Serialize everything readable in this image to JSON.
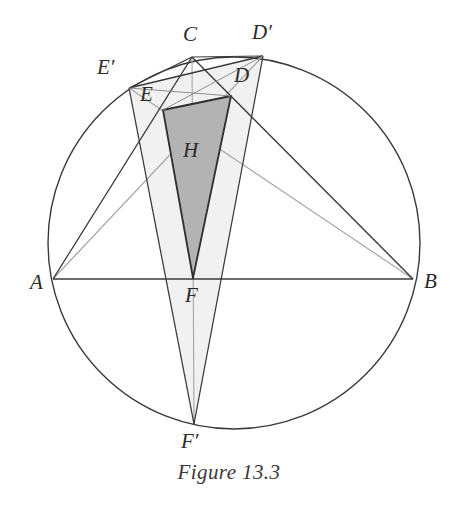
{
  "figure": {
    "caption": "Figure 13.3",
    "type": "geometry-diagram",
    "canvas": {
      "width": 458,
      "height": 507
    },
    "colors": {
      "stroke_dark": "#3a3a3a",
      "stroke_light": "#9a9a9a",
      "fill_dark_triangle": "#b3b3b3",
      "fill_light_triangle": "#f1f1f1",
      "background": "#ffffff",
      "label_color": "#2b2b2b"
    },
    "circle": {
      "cx": 234,
      "cy": 243,
      "r": 186
    },
    "points": {
      "A": {
        "x": 53,
        "y": 279,
        "label": "A",
        "label_x": 30,
        "label_y": 272
      },
      "B": {
        "x": 413,
        "y": 279,
        "label": "B",
        "label_x": 424,
        "label_y": 271
      },
      "C": {
        "x": 192,
        "y": 57,
        "label": "C",
        "label_x": 183,
        "label_y": 24
      },
      "D": {
        "x": 231,
        "y": 96,
        "label": "D",
        "label_x": 234,
        "label_y": 65
      },
      "E": {
        "x": 163,
        "y": 110,
        "label": "E",
        "label_x": 140,
        "label_y": 84
      },
      "F": {
        "x": 193,
        "y": 278,
        "label": "F",
        "label_x": 185,
        "label_y": 285
      },
      "Dp": {
        "x": 263,
        "y": 56,
        "label": "D′",
        "label_x": 252,
        "label_y": 22
      },
      "Ep": {
        "x": 129,
        "y": 88,
        "label": "E′",
        "label_x": 97,
        "label_y": 57
      },
      "Fp": {
        "x": 194,
        "y": 424,
        "label": "F′",
        "label_x": 181,
        "label_y": 431
      },
      "H": {
        "x": 192,
        "y": 150,
        "label": "H",
        "label_x": 183,
        "label_y": 140
      }
    },
    "shapes": {
      "outer_triangle": {
        "name": "triangle-ABC",
        "vertices": [
          "A",
          "B",
          "C"
        ]
      },
      "reflected_triangle": {
        "name": "triangle-EpDpFp",
        "vertices": [
          "Ep",
          "Dp",
          "Fp"
        ],
        "fill": "light"
      },
      "orthic_triangle": {
        "name": "triangle-DEF",
        "vertices": [
          "D",
          "E",
          "F"
        ],
        "fill": "dark"
      }
    },
    "segments": [
      {
        "name": "chord-AB",
        "from": "A",
        "to": "B",
        "weight": "dark"
      },
      {
        "name": "side-AC",
        "from": "A",
        "to": "C",
        "weight": "dark"
      },
      {
        "name": "side-BC",
        "from": "B",
        "to": "C",
        "weight": "dark"
      },
      {
        "name": "altitude-CF-extended",
        "from": "C",
        "to": "Fp",
        "weight": "light"
      },
      {
        "name": "altitude-AD-extended",
        "from": "A",
        "to": "Dp",
        "weight": "light"
      },
      {
        "name": "altitude-BE-extended",
        "from": "B",
        "to": "Ep",
        "weight": "light"
      },
      {
        "name": "cevian-AE",
        "from": "A",
        "to": "Ep",
        "weight": "dark"
      },
      {
        "name": "cevian-BD",
        "from": "B",
        "to": "Dp",
        "weight": "dark"
      },
      {
        "name": "chord-CEp",
        "from": "C",
        "to": "Ep",
        "weight": "dark"
      },
      {
        "name": "chord-CDp",
        "from": "C",
        "to": "Dp",
        "weight": "dark"
      },
      {
        "name": "side-EF-dark",
        "from": "E",
        "to": "F",
        "weight": "dark"
      },
      {
        "name": "side-DF-dark",
        "from": "D",
        "to": "F",
        "weight": "dark"
      },
      {
        "name": "side-ED-dark",
        "from": "E",
        "to": "D",
        "weight": "dark"
      },
      {
        "name": "diagonal-EH-D",
        "from": "E",
        "to": "D",
        "weight": "light"
      },
      {
        "name": "side-EpFp",
        "from": "Ep",
        "to": "Fp",
        "weight": "dark"
      },
      {
        "name": "side-DpFp",
        "from": "Dp",
        "to": "Fp",
        "weight": "dark"
      },
      {
        "name": "side-EpDp",
        "from": "Ep",
        "to": "Dp",
        "weight": "dark"
      }
    ]
  }
}
